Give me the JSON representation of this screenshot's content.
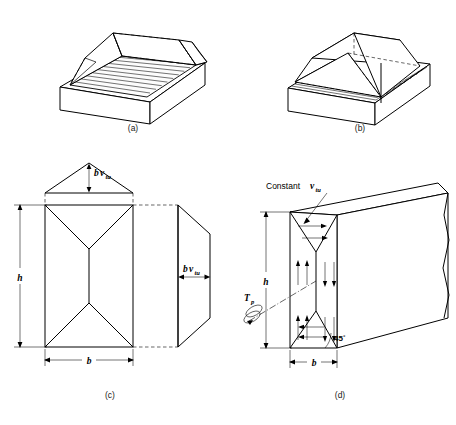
{
  "figure": {
    "panels": [
      {
        "id": "a",
        "caption": "(a)",
        "description": "Rectangular tray with sloped end walls and ribbed floor"
      },
      {
        "id": "b",
        "caption": "(b)",
        "description": "Sand heap formed in rectangular tray with hipped ridge"
      },
      {
        "id": "c",
        "caption": "(c)",
        "description": "Plan and elevation projections of the sand heap"
      },
      {
        "id": "d",
        "caption": "(d)",
        "description": "Three dimensional block showing constant shear stress flow"
      }
    ]
  },
  "labels": {
    "shear_stress_symbol": "v",
    "shear_stress_subscript": "tu",
    "heap_height_prefix": "b",
    "constant_text": "Constant",
    "height_symbol": "h",
    "width_symbol": "b",
    "torque_symbol": "T",
    "torque_subscript": "p",
    "angle_text": "45",
    "angle_unit": "°"
  },
  "colors": {
    "stroke": "#000000",
    "background": "#ffffff",
    "caption": "#1a1a1a"
  }
}
